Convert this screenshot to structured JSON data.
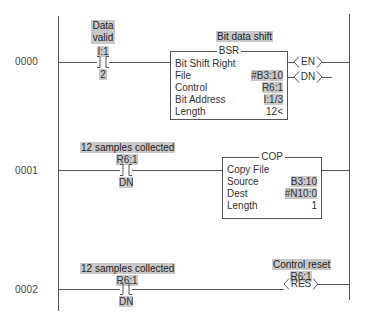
{
  "rungs": [
    {
      "number": "0000",
      "contact": {
        "description": [
          "Data",
          "valid"
        ],
        "address": "I:1",
        "bit": "2",
        "type": "XIC"
      },
      "instruction": {
        "description": "Bit data shift",
        "mnemonic": "BSR",
        "title": "Bit Shift Right",
        "params": [
          {
            "key": "File",
            "value": "#B3:10"
          },
          {
            "key": "Control",
            "value": "R6:1"
          },
          {
            "key": "Bit Address",
            "value": "I:1/3"
          },
          {
            "key": "Length",
            "value": "12<"
          }
        ],
        "outputs": [
          "EN",
          "DN"
        ]
      }
    },
    {
      "number": "0001",
      "contact": {
        "description": "12 samples collected",
        "address": "R6:1",
        "bit": "DN",
        "type": "XIC"
      },
      "instruction": {
        "mnemonic": "COP",
        "title": "Copy File",
        "params": [
          {
            "key": "Source",
            "value": "B3:10"
          },
          {
            "key": "Dest",
            "value": "#N10:0"
          },
          {
            "key": "Length",
            "value": "1"
          }
        ]
      }
    },
    {
      "number": "0002",
      "contact": {
        "description": "12 samples collected",
        "address": "R6:1",
        "bit": "DN",
        "type": "XIC"
      },
      "output": {
        "description": "Control reset",
        "address": "R6:1",
        "coil": "RES"
      }
    }
  ],
  "colors": {
    "rail": "#555555",
    "highlight": "#c8c8c8",
    "background": "#ffffff"
  }
}
